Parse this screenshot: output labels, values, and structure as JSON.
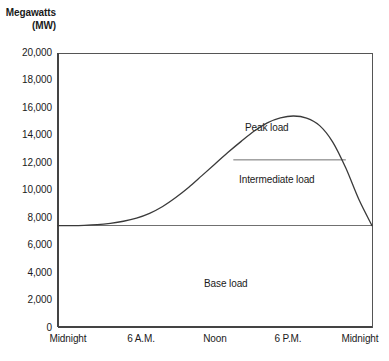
{
  "chart_data": {
    "type": "area",
    "title": "",
    "ylabel_line1": "Megawatts",
    "ylabel_line2": "(MW)",
    "xlabel": "",
    "ylim": [
      0,
      20000
    ],
    "grid": false,
    "legend_position": "none",
    "y_ticks": [
      {
        "value": 20000,
        "label": "20,000"
      },
      {
        "value": 18000,
        "label": "18,000"
      },
      {
        "value": 16000,
        "label": "16,000"
      },
      {
        "value": 14000,
        "label": "14,000"
      },
      {
        "value": 12000,
        "label": "12,000"
      },
      {
        "value": 10000,
        "label": "10,000"
      },
      {
        "value": 8000,
        "label": "8,000"
      },
      {
        "value": 6000,
        "label": "6,000"
      },
      {
        "value": 4000,
        "label": "4,000"
      },
      {
        "value": 2000,
        "label": "2,000"
      },
      {
        "value": 0,
        "label": "0"
      }
    ],
    "x_ticks": [
      {
        "hour": 0,
        "label": "Midnight"
      },
      {
        "hour": 6,
        "label": "6 A.M."
      },
      {
        "hour": 12,
        "label": "Noon"
      },
      {
        "hour": 18,
        "label": "6 P.M."
      },
      {
        "hour": 24,
        "label": "Midnight"
      }
    ],
    "xlim_hours": [
      0,
      24
    ],
    "series": [
      {
        "name": "Total load curve",
        "x": [
          0,
          1,
          2,
          3,
          4,
          5,
          6,
          7,
          8,
          9,
          10,
          11,
          12,
          13,
          14,
          15,
          16,
          17,
          18,
          19,
          20,
          21,
          22,
          23,
          24
        ],
        "values": [
          7400,
          7400,
          7420,
          7470,
          7570,
          7720,
          7950,
          8300,
          8800,
          9450,
          10200,
          11050,
          11900,
          12750,
          13550,
          14300,
          14900,
          15260,
          15400,
          15250,
          14700,
          13500,
          11600,
          9300,
          7400
        ]
      }
    ],
    "reference_lines": [
      {
        "name": "base-load-line",
        "value": 7400,
        "label": "Base load boundary",
        "x_start_hour": 0,
        "x_end_hour": 24
      },
      {
        "name": "peak-intermediate-divider",
        "value": 12200,
        "label": "Peak / intermediate boundary",
        "x_start_hour": 13.4,
        "x_end_hour": 22.0
      }
    ],
    "annotations": [
      {
        "name": "peak-load-label",
        "text": "Peak load",
        "x_hour": 17.0,
        "y_value": 13800
      },
      {
        "name": "intermediate-load-label",
        "text": "Intermediate load",
        "x_hour": 17.4,
        "y_value": 10000
      },
      {
        "name": "base-load-label",
        "text": "Base load",
        "x_hour": 14.0,
        "y_value": 3600
      }
    ],
    "colors": {
      "axis": "#555555",
      "curve": "#3a3a3a",
      "reference_line": "#707070",
      "text": "#1a1a1a",
      "background": "#ffffff"
    }
  }
}
